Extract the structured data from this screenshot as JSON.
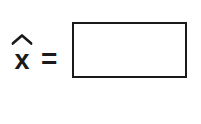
{
  "canvas": {
    "width_px": 201,
    "height_px": 124,
    "background_color": "#ffffff",
    "ink_color": "#1a1a1a"
  },
  "equation": {
    "variable_symbol": "x",
    "accent_icon": "circumflex-hat-icon",
    "accent_description": "hat",
    "full_notation": "x̂",
    "equals_symbol": "=",
    "answer_box": {
      "value": "",
      "placeholder": "",
      "border_color": "#1a1a1a",
      "fill_color": "#ffffff",
      "width_px": 115,
      "height_px": 56
    }
  }
}
